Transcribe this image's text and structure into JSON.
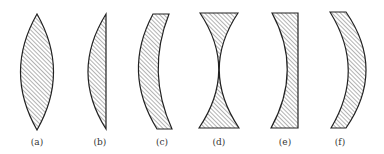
{
  "figure": {
    "lenses": [
      {
        "id": "a",
        "label": "(a)",
        "type": "biconvex"
      },
      {
        "id": "b",
        "label": "(b)",
        "type": "plano-convex"
      },
      {
        "id": "c",
        "label": "(c)",
        "type": "positive-meniscus"
      },
      {
        "id": "d",
        "label": "(d)",
        "type": "biconcave"
      },
      {
        "id": "e",
        "label": "(e)",
        "type": "plano-concave"
      },
      {
        "id": "f",
        "label": "(f)",
        "type": "negative-meniscus"
      }
    ],
    "colors": {
      "stroke": "#222222",
      "hatch": "#444444",
      "background": "#ffffff"
    }
  }
}
